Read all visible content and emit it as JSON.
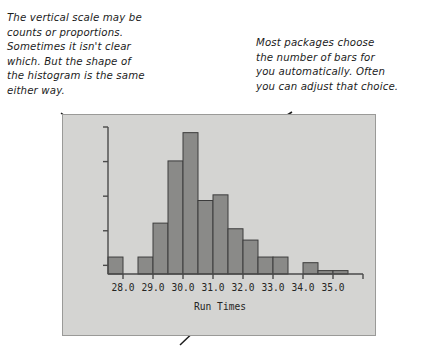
{
  "annotations": [
    {
      "name": "vertical-scale-note",
      "text": "The vertical scale may be\ncounts or proportions.\nSometimes it isn't clear\nwhich. But the shape of\nthe histogram is the same\neither way."
    },
    {
      "name": "number-of-bars-note",
      "text": "Most packages choose\nthe number of bars for\nyou automatically. Often\nyou can adjust that choice."
    }
  ],
  "colors": {
    "panel_background": "#d4d4d2",
    "panel_border": "#9a9a98",
    "bar_fill": "#8a8a88",
    "bar_stroke": "#3c3c3c",
    "axis": "#4a4a4a",
    "text": "#1c1c1c"
  },
  "chart_data": {
    "type": "bar",
    "title": "",
    "subtitle": "",
    "xlabel": "Run Times",
    "ylabel": "",
    "x_tick_labels": [
      "28.0",
      "29.0",
      "30.0",
      "31.0",
      "32.0",
      "33.0",
      "34.0",
      "35.0"
    ],
    "x_tick_values": [
      28.0,
      29.0,
      30.0,
      31.0,
      32.0,
      33.0,
      34.0,
      35.0
    ],
    "y_tick_labels": [],
    "y_tick_count": 5,
    "y_axis_labeled": false,
    "grid": false,
    "legend": null,
    "xlim": [
      27.5,
      36.0
    ],
    "ylim": [
      0,
      26
    ],
    "bin_width": 0.5,
    "bin_left_edges": [
      27.5,
      28.0,
      28.5,
      29.0,
      29.5,
      30.0,
      30.5,
      31.0,
      31.5,
      32.0,
      32.5,
      33.0,
      33.5,
      34.0,
      34.5,
      35.0,
      35.5
    ],
    "categories": [
      "27.5-28.0",
      "28.0-28.5",
      "28.5-29.0",
      "29.0-29.5",
      "29.5-30.0",
      "30.0-30.5",
      "30.5-31.0",
      "31.0-31.5",
      "31.5-32.0",
      "32.0-32.5",
      "32.5-33.0",
      "33.0-33.5",
      "33.5-34.0",
      "34.0-34.5",
      "34.5-35.0",
      "35.0-35.5",
      "35.5-36.0"
    ],
    "values": [
      3,
      0,
      3,
      9,
      20,
      25,
      13,
      14,
      8,
      6,
      3,
      3,
      0,
      2,
      0.6,
      0.6,
      0
    ]
  }
}
